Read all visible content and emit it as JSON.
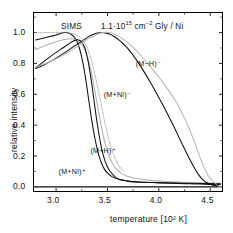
{
  "figure": {
    "kind": "scientific-plot",
    "background": "#ffffff",
    "frame_color": "#000000"
  },
  "header": {
    "technique": "SIMS",
    "coverage_value": "1.1·10",
    "coverage_exponent": "15",
    "units_prefix": " cm",
    "units_exponent": "−2",
    "sample": " Gly / Ni",
    "full_text": "SIMS    1.1·10¹⁵ cm⁻² Gly / Ni"
  },
  "chart_data": {
    "type": "line",
    "xlabel": "temperature  [10² K]",
    "ylabel": "relative intensity",
    "xlim": [
      2.78,
      4.62
    ],
    "ylim": [
      -0.03,
      1.13
    ],
    "xticks": [
      3.0,
      3.5,
      4.0,
      4.5
    ],
    "xtick_labels": [
      "3.0",
      "3.5",
      "4.0",
      "4.5"
    ],
    "yticks": [
      0.0,
      0.2,
      0.4,
      0.6,
      0.8,
      1.0
    ],
    "ytick_labels": [
      "0.0",
      "0.2",
      "0.4",
      "0.6",
      "0.8",
      "1.0"
    ],
    "grid": false,
    "legend": "inline-annotations",
    "series": [
      {
        "name": "(M+H)+",
        "label": "(M+H)⁺",
        "color": "#111111",
        "style": "solid",
        "label_x": 3.49,
        "label_y": 0.235,
        "x": [
          2.8,
          2.85,
          2.9,
          2.95,
          3.0,
          3.05,
          3.08,
          3.11,
          3.14,
          3.17,
          3.2,
          3.23,
          3.26,
          3.29,
          3.32,
          3.35,
          3.38,
          3.41,
          3.44,
          3.47,
          3.5,
          3.54,
          3.58,
          3.62,
          3.66,
          3.7,
          3.78,
          3.86,
          3.94,
          4.02,
          4.1,
          4.2,
          4.3,
          4.4,
          4.5,
          4.6
        ],
        "y": [
          0.952,
          0.96,
          0.968,
          0.976,
          0.984,
          0.996,
          1.0,
          0.999,
          0.992,
          0.975,
          0.945,
          0.892,
          0.808,
          0.69,
          0.552,
          0.42,
          0.307,
          0.219,
          0.156,
          0.115,
          0.09,
          0.068,
          0.055,
          0.047,
          0.042,
          0.038,
          0.033,
          0.03,
          0.028,
          0.026,
          0.024,
          0.022,
          0.02,
          0.018,
          0.016,
          0.015
        ]
      },
      {
        "name": "(M+H)+ companion",
        "label": "",
        "color": "#aeaeae",
        "style": "solid",
        "x": [
          2.8,
          2.86,
          2.92,
          2.98,
          3.04,
          3.1,
          3.14,
          3.18,
          3.22,
          3.26,
          3.3,
          3.34,
          3.38,
          3.42,
          3.46,
          3.5,
          3.54,
          3.58,
          3.64,
          3.7,
          3.8,
          3.92,
          4.04,
          4.18,
          4.32,
          4.46,
          4.6
        ],
        "y": [
          0.89,
          0.906,
          0.922,
          0.936,
          0.948,
          0.957,
          0.96,
          0.957,
          0.944,
          0.915,
          0.855,
          0.752,
          0.612,
          0.462,
          0.328,
          0.228,
          0.162,
          0.122,
          0.086,
          0.068,
          0.052,
          0.042,
          0.036,
          0.031,
          0.028,
          0.025,
          0.023
        ]
      },
      {
        "name": "(M+Ni)+",
        "label": "(M+Ni)⁺",
        "color": "#111111",
        "style": "solid",
        "label_x": 3.18,
        "label_y": 0.095,
        "x": [
          2.8,
          2.86,
          2.92,
          2.98,
          3.02,
          3.06,
          3.1,
          3.13,
          3.16,
          3.19,
          3.22,
          3.25,
          3.28,
          3.31,
          3.34,
          3.37,
          3.4,
          3.44,
          3.48,
          3.52,
          3.58,
          3.64,
          3.72,
          3.82,
          3.94,
          4.08,
          4.24,
          4.4,
          4.6
        ],
        "y": [
          0.77,
          0.802,
          0.833,
          0.862,
          0.88,
          0.898,
          0.916,
          0.93,
          0.942,
          0.951,
          0.952,
          0.939,
          0.9,
          0.82,
          0.7,
          0.556,
          0.412,
          0.258,
          0.16,
          0.106,
          0.062,
          0.044,
          0.034,
          0.03,
          0.028,
          0.026,
          0.024,
          0.022,
          0.02
        ]
      },
      {
        "name": "(M-H)-",
        "label": "(M−H)⁻",
        "color": "#111111",
        "style": "solid",
        "label_x": 3.93,
        "label_y": 0.795,
        "x": [
          2.8,
          2.9,
          3.0,
          3.08,
          3.14,
          3.2,
          3.26,
          3.32,
          3.38,
          3.42,
          3.46,
          3.5,
          3.54,
          3.58,
          3.62,
          3.68,
          3.74,
          3.8,
          3.86,
          3.92,
          3.98,
          4.04,
          4.1,
          4.16,
          4.22,
          4.28,
          4.34,
          4.4,
          4.46,
          4.52,
          4.58
        ],
        "y": [
          0.0,
          0.0,
          0.0,
          0.0,
          0.0,
          0.0,
          0.0,
          0.0,
          0.0,
          0.0,
          0.0,
          0.0,
          0.0,
          0.0,
          0.0,
          0.0,
          0.0,
          0.0,
          0.0,
          0.0,
          0.0,
          0.0,
          0.0,
          0.0,
          0.0,
          0.0,
          0.0,
          0.0,
          0.0,
          0.0,
          0.0
        ]
      },
      {
        "name": "(M+Ni)- main",
        "label": "(M+Ni)⁻",
        "color": "#111111",
        "style": "solid",
        "label_x": 3.62,
        "label_y": 0.595,
        "x": [
          2.8,
          2.88,
          2.96,
          3.02,
          3.08,
          3.14,
          3.2,
          3.26,
          3.32,
          3.36,
          3.4,
          3.44,
          3.48,
          3.52,
          3.56,
          3.6,
          3.64,
          3.68,
          3.74,
          3.8,
          3.86,
          3.92,
          3.98,
          4.04,
          4.1,
          4.16,
          4.22,
          4.26,
          4.3,
          4.34,
          4.38,
          4.42,
          4.46,
          4.52,
          4.58
        ],
        "y": [
          0.768,
          0.79,
          0.818,
          0.842,
          0.868,
          0.896,
          0.922,
          0.948,
          0.975,
          0.988,
          0.997,
          1.0,
          0.998,
          0.99,
          0.976,
          0.958,
          0.936,
          0.91,
          0.862,
          0.805,
          0.742,
          0.675,
          0.604,
          0.53,
          0.452,
          0.372,
          0.288,
          0.234,
          0.18,
          0.13,
          0.086,
          0.052,
          0.03,
          0.012,
          0.006
        ]
      },
      {
        "name": "(M+Ni)- companion",
        "label": "",
        "color": "#b6b6b6",
        "style": "solid",
        "x": [
          2.8,
          2.9,
          3.0,
          3.08,
          3.16,
          3.24,
          3.32,
          3.38,
          3.44,
          3.5,
          3.56,
          3.62,
          3.68,
          3.76,
          3.84,
          3.92,
          4.0,
          4.08,
          4.16,
          4.24,
          4.3,
          4.36,
          4.42,
          4.48,
          4.56
        ],
        "y": [
          0.775,
          0.8,
          0.83,
          0.858,
          0.89,
          0.925,
          0.962,
          0.982,
          0.998,
          1.002,
          0.992,
          0.972,
          0.944,
          0.898,
          0.84,
          0.778,
          0.712,
          0.64,
          0.56,
          0.46,
          0.372,
          0.268,
          0.16,
          0.074,
          0.018
        ]
      },
      {
        "name": "top dotted trace",
        "label": "",
        "color": "#9a9a9a",
        "style": "dotted",
        "x": [
          2.8,
          2.88,
          2.96,
          3.02,
          3.08,
          3.12,
          3.16,
          3.2,
          3.24,
          3.28,
          3.32,
          3.36,
          3.4,
          3.44,
          3.48,
          3.54,
          3.6,
          3.66
        ],
        "y": [
          1.0,
          1.0,
          1.0,
          1.0,
          0.999,
          0.997,
          0.993,
          0.985,
          0.968,
          0.932,
          0.87,
          0.778,
          0.66,
          0.53,
          0.4,
          0.248,
          0.15,
          0.098
        ]
      }
    ]
  },
  "annotations": [
    {
      "id": "m-minus-h",
      "text": "(M−H)⁻"
    },
    {
      "id": "m-plus-ni-minus",
      "text": "(M+Ni)⁻"
    },
    {
      "id": "m-plus-h-plus",
      "text": "(M+H)⁺"
    },
    {
      "id": "m-plus-ni-plus",
      "text": "(M+Ni)⁺"
    }
  ]
}
